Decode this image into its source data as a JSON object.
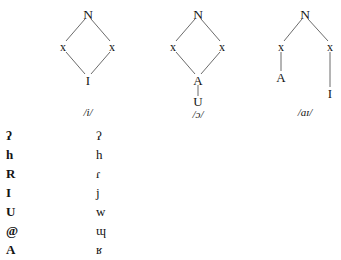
{
  "figure": {
    "background_color": "#ffffff",
    "ink_color": "#141414",
    "trees": [
      {
        "id": "tree-structure-i",
        "phoneme_label": "/i/",
        "nodes": [
          {
            "id": "root",
            "label": "N",
            "x": 55,
            "y": 14,
            "role": "root"
          },
          {
            "id": "x-left",
            "label": "x",
            "x": 30,
            "y": 47,
            "role": "skeletal-slot"
          },
          {
            "id": "x-right",
            "label": "x",
            "x": 79,
            "y": 47,
            "role": "skeletal-slot"
          },
          {
            "id": "terminal-i",
            "label": "I",
            "x": 55,
            "y": 80,
            "role": "melody"
          }
        ],
        "edges": [
          {
            "from": "root",
            "to": "x-left"
          },
          {
            "from": "root",
            "to": "x-right"
          },
          {
            "from": "x-left",
            "to": "terminal-i"
          },
          {
            "from": "x-right",
            "to": "terminal-i"
          }
        ]
      },
      {
        "id": "tree-structure-open-o",
        "phoneme_label": "/ɔ/",
        "nodes": [
          {
            "id": "root",
            "label": "N",
            "x": 55,
            "y": 14,
            "role": "root"
          },
          {
            "id": "x-left",
            "label": "x",
            "x": 30,
            "y": 47,
            "role": "skeletal-slot"
          },
          {
            "id": "x-right",
            "label": "x",
            "x": 79,
            "y": 47,
            "role": "skeletal-slot"
          },
          {
            "id": "terminal-a",
            "label": "A",
            "x": 55,
            "y": 80,
            "role": "melody"
          },
          {
            "id": "terminal-u",
            "label": "U",
            "x": 55,
            "y": 101,
            "role": "melody"
          }
        ],
        "edges": [
          {
            "from": "root",
            "to": "x-left"
          },
          {
            "from": "root",
            "to": "x-right"
          },
          {
            "from": "x-left",
            "to": "terminal-a"
          },
          {
            "from": "x-right",
            "to": "terminal-a"
          },
          {
            "from": "terminal-a",
            "to": "terminal-u"
          }
        ]
      },
      {
        "id": "tree-structure-ai",
        "phoneme_label": "/aɪ/",
        "nodes": [
          {
            "id": "root",
            "label": "N",
            "x": 55,
            "y": 14,
            "role": "root"
          },
          {
            "id": "x-left",
            "label": "x",
            "x": 31,
            "y": 47,
            "role": "skeletal-slot"
          },
          {
            "id": "x-right",
            "label": "x",
            "x": 80,
            "y": 47,
            "role": "skeletal-slot"
          },
          {
            "id": "terminal-a",
            "label": "A",
            "x": 31,
            "y": 77,
            "role": "melody"
          },
          {
            "id": "terminal-i",
            "label": "I",
            "x": 80,
            "y": 93,
            "role": "melody"
          }
        ],
        "edges": [
          {
            "from": "root",
            "to": "x-left"
          },
          {
            "from": "root",
            "to": "x-right"
          },
          {
            "from": "x-left",
            "to": "terminal-a"
          },
          {
            "from": "x-right",
            "to": "terminal-i"
          }
        ]
      }
    ],
    "symbol_table": {
      "left_column": [
        {
          "symbol": "ʔ",
          "name": "glottal-stop-element"
        },
        {
          "symbol": "h",
          "name": "h-element"
        },
        {
          "symbol": "R",
          "name": "r-element"
        },
        {
          "symbol": "I",
          "name": "i-element"
        },
        {
          "symbol": "U",
          "name": "u-element"
        },
        {
          "symbol": "@",
          "name": "schwa-element"
        },
        {
          "symbol": "A",
          "name": "a-element"
        }
      ],
      "right_column": [
        {
          "symbol": "ʔ",
          "name": "glottal-stop-ipa"
        },
        {
          "symbol": "h",
          "name": "voiceless-glottal-fricative-ipa"
        },
        {
          "symbol": "ɾ",
          "name": "alveolar-tap-ipa"
        },
        {
          "symbol": "j",
          "name": "palatal-approximant-ipa"
        },
        {
          "symbol": "w",
          "name": "labial-velar-approximant-ipa"
        },
        {
          "symbol": "ɰ",
          "name": "velar-approximant-ipa"
        },
        {
          "symbol": "ʁ",
          "name": "uvular-fricative-ipa"
        }
      ]
    }
  }
}
